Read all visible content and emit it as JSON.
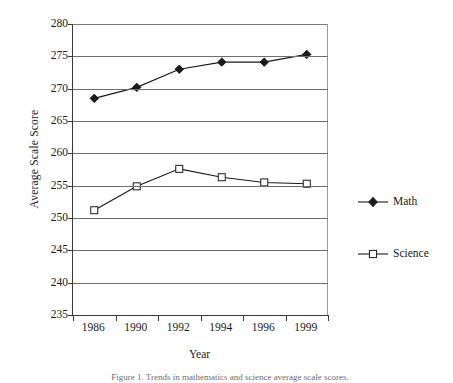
{
  "chart_data": {
    "type": "line",
    "title": "",
    "xlabel": "Year",
    "ylabel": "Average Scale Score",
    "categories": [
      "1986",
      "1990",
      "1992",
      "1994",
      "1996",
      "1999"
    ],
    "ylim": [
      235,
      280
    ],
    "ytick_step": 5,
    "yticks": [
      235,
      240,
      245,
      250,
      255,
      260,
      265,
      270,
      275,
      280
    ],
    "grid": "horizontal",
    "legend_position": "right",
    "series": [
      {
        "name": "Math",
        "marker": "filled-diamond",
        "color": "#1a1a1a",
        "values": [
          268.5,
          270.2,
          273.0,
          274.1,
          274.1,
          275.3
        ]
      },
      {
        "name": "Science",
        "marker": "open-square",
        "color": "#1a1a1a",
        "values": [
          251.2,
          254.9,
          257.6,
          256.3,
          255.5,
          255.3
        ]
      }
    ]
  },
  "axes": {
    "y_title": "Average Scale Score",
    "x_title": "Year",
    "y_tick_labels": [
      "280",
      "275",
      "270",
      "265",
      "260",
      "255",
      "250",
      "245",
      "240",
      "235"
    ],
    "x_tick_labels": [
      "1986",
      "1990",
      "1992",
      "1994",
      "1996",
      "1999"
    ]
  },
  "legend": {
    "math_label": "Math",
    "science_label": "Science"
  },
  "caption": {
    "text": "Figure 1. Trends in mathematics and science average scale scores."
  },
  "colors": {
    "ink": "#1a1a1a",
    "grid": "#6e6e6e",
    "axis": "#3a3a3a",
    "background": "#ffffff"
  }
}
